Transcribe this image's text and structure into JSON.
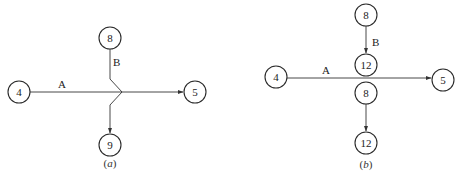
{
  "figures": [
    {
      "id": "a",
      "caption": "(a)",
      "caption_italic_letter": "a",
      "nodes": [
        {
          "id": "a4",
          "label": "4"
        },
        {
          "id": "a8",
          "label": "8"
        },
        {
          "id": "a9",
          "label": "9"
        },
        {
          "id": "a5",
          "label": "5"
        }
      ],
      "edges": [
        {
          "from": "a4",
          "to": "a5",
          "label": "A",
          "note": "horizontal arrow"
        },
        {
          "from": "a8",
          "to": "a9",
          "label": "B",
          "note": "vertical arrow with kink crossing A"
        }
      ]
    },
    {
      "id": "b",
      "caption": "(b)",
      "caption_italic_letter": "b",
      "nodes": [
        {
          "id": "b4",
          "label": "4"
        },
        {
          "id": "b8top",
          "label": "8"
        },
        {
          "id": "b12top",
          "label": "12"
        },
        {
          "id": "b8bot",
          "label": "8"
        },
        {
          "id": "b12bot",
          "label": "12"
        },
        {
          "id": "b5",
          "label": "5"
        }
      ],
      "edges": [
        {
          "from": "b4",
          "to": "b5",
          "label": "A"
        },
        {
          "from": "b8top",
          "to": "b12top",
          "label": "B"
        },
        {
          "from": "b8bot",
          "to": "b12bot",
          "label": ""
        }
      ]
    }
  ]
}
